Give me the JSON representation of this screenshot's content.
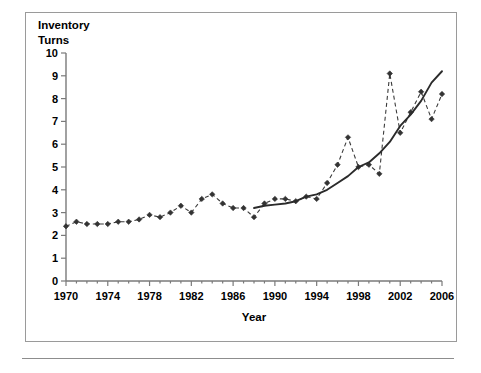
{
  "chart_data": {
    "type": "line",
    "title": "",
    "xlabel": "Year",
    "ylabel": "Inventory Turns",
    "ylabel_line1": "Inventory",
    "ylabel_line2": "Turns",
    "xlim": [
      1970,
      2006
    ],
    "ylim": [
      0,
      10
    ],
    "x_ticks": [
      1970,
      1974,
      1978,
      1982,
      1986,
      1990,
      1994,
      1998,
      2002,
      2006
    ],
    "x_tick_labels": [
      "1970",
      "1974",
      "1978",
      "1982",
      "1986",
      "1990",
      "1994",
      "1998",
      "2002",
      "2006"
    ],
    "x_minor_interval": 1,
    "y_ticks": [
      0,
      1,
      2,
      3,
      4,
      5,
      6,
      7,
      8,
      9,
      10
    ],
    "y_tick_labels": [
      "0",
      "1",
      "2",
      "3",
      "4",
      "5",
      "6",
      "7",
      "8",
      "9",
      "10"
    ],
    "grid": false,
    "legend": null,
    "legend_position": "none",
    "series": [
      {
        "name": "Inventory turns (annual)",
        "style": "dashed",
        "marker": "diamond",
        "color": "#333333",
        "x": [
          1970,
          1971,
          1972,
          1973,
          1974,
          1975,
          1976,
          1977,
          1978,
          1979,
          1980,
          1981,
          1982,
          1983,
          1984,
          1985,
          1986,
          1987,
          1988,
          1989,
          1990,
          1991,
          1992,
          1993,
          1994,
          1995,
          1996,
          1997,
          1998,
          1999,
          2000,
          2001,
          2002,
          2003,
          2004,
          2005,
          2006
        ],
        "values": [
          2.4,
          2.6,
          2.5,
          2.5,
          2.5,
          2.6,
          2.6,
          2.7,
          2.9,
          2.8,
          3.0,
          3.3,
          3.0,
          3.6,
          3.8,
          3.4,
          3.2,
          3.2,
          2.8,
          3.4,
          3.6,
          3.6,
          3.5,
          3.7,
          3.6,
          4.3,
          5.1,
          6.3,
          5.0,
          5.1,
          4.7,
          9.1,
          6.5,
          7.4,
          8.3,
          7.1,
          8.2
        ]
      },
      {
        "name": "Trend (smoothed)",
        "style": "solid",
        "marker": "none",
        "color": "#2b2b2b",
        "x": [
          1988,
          1989,
          1990,
          1991,
          1992,
          1993,
          1994,
          1995,
          1996,
          1997,
          1998,
          1999,
          2000,
          2001,
          2002,
          2003,
          2004,
          2005,
          2006
        ],
        "values": [
          3.2,
          3.3,
          3.35,
          3.4,
          3.5,
          3.7,
          3.8,
          4.0,
          4.3,
          4.6,
          5.0,
          5.2,
          5.6,
          6.1,
          6.8,
          7.3,
          7.9,
          8.7,
          9.2
        ]
      }
    ]
  }
}
